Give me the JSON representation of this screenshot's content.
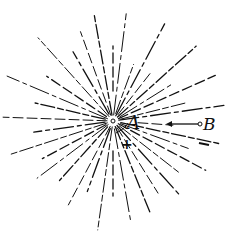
{
  "diagram": {
    "center": {
      "x": 113,
      "y": 121
    },
    "labels": {
      "A": "A",
      "B": "B",
      "plus": "+",
      "minus": "−"
    },
    "colors": {
      "ink": "#111111",
      "background": "#ffffff"
    },
    "rays": [
      {
        "angle": -100,
        "r1": 6,
        "r2": 108
      },
      {
        "angle": -83,
        "r1": 6,
        "r2": 108
      },
      {
        "angle": -90,
        "r1": 30,
        "r2": 75
      },
      {
        "angle": -70,
        "r1": 8,
        "r2": 60
      },
      {
        "angle": -62,
        "r1": 6,
        "r2": 110
      },
      {
        "angle": -52,
        "r1": 8,
        "r2": 60
      },
      {
        "angle": -42,
        "r1": 6,
        "r2": 112
      },
      {
        "angle": -32,
        "r1": 8,
        "r2": 70
      },
      {
        "angle": -24,
        "r1": 6,
        "r2": 112
      },
      {
        "angle": -14,
        "r1": 8,
        "r2": 75
      },
      {
        "angle": -8,
        "r1": 6,
        "r2": 112
      },
      {
        "angle": 4,
        "r1": 25,
        "r2": 60
      },
      {
        "angle": 12,
        "r1": 8,
        "r2": 108
      },
      {
        "angle": 20,
        "r1": 8,
        "r2": 80
      },
      {
        "angle": 28,
        "r1": 6,
        "r2": 105
      },
      {
        "angle": 38,
        "r1": 8,
        "r2": 85
      },
      {
        "angle": 48,
        "r1": 6,
        "r2": 100
      },
      {
        "angle": 58,
        "r1": 8,
        "r2": 85
      },
      {
        "angle": 68,
        "r1": 6,
        "r2": 100
      },
      {
        "angle": 80,
        "r1": 8,
        "r2": 100
      },
      {
        "angle": 90,
        "r1": 30,
        "r2": 75
      },
      {
        "angle": 98,
        "r1": 6,
        "r2": 110
      },
      {
        "angle": 110,
        "r1": 8,
        "r2": 75
      },
      {
        "angle": 118,
        "r1": 6,
        "r2": 95
      },
      {
        "angle": 132,
        "r1": 8,
        "r2": 80
      },
      {
        "angle": 143,
        "r1": 6,
        "r2": 95
      },
      {
        "angle": 152,
        "r1": 8,
        "r2": 80
      },
      {
        "angle": 162,
        "r1": 6,
        "r2": 108
      },
      {
        "angle": 172,
        "r1": 8,
        "r2": 80
      },
      {
        "angle": 182,
        "r1": 6,
        "r2": 110
      },
      {
        "angle": 193,
        "r1": 8,
        "r2": 80
      },
      {
        "angle": 203,
        "r1": 6,
        "r2": 115
      },
      {
        "angle": 214,
        "r1": 8,
        "r2": 80
      },
      {
        "angle": 228,
        "r1": 6,
        "r2": 112
      },
      {
        "angle": 240,
        "r1": 8,
        "r2": 80
      },
      {
        "angle": 250,
        "r1": 6,
        "r2": 95
      }
    ]
  }
}
